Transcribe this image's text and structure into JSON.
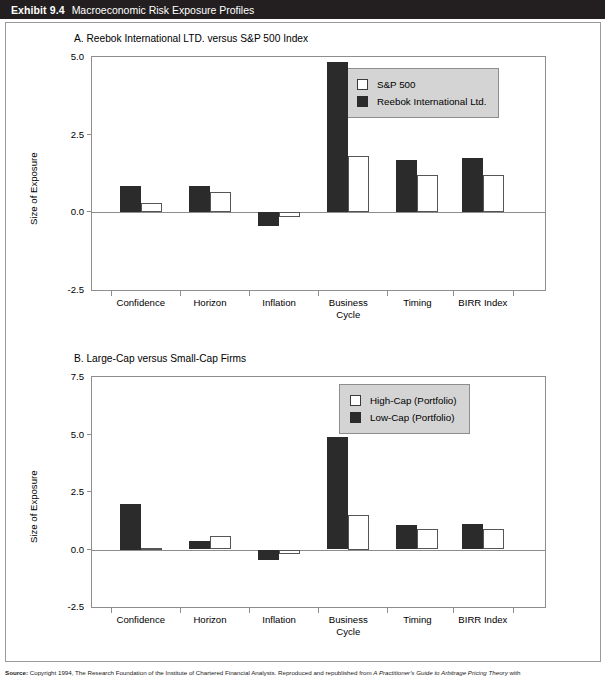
{
  "exhibit": {
    "number": "Exhibit 9.4",
    "title": "Macroeconomic Risk Exposure Profiles"
  },
  "source": {
    "label": "Source:",
    "text_before_italic": " Copyright 1994, The Research Foundation of the Institute of Chartered Financial Analysts. Reproduced and republished from ",
    "italic_title": "A Practitioner's Guide to Arbitrage Pricing Theory",
    "text_after_italic": " with"
  },
  "colors": {
    "header_bar": "#231f20",
    "dark_series": "#2b2b2b",
    "light_series": "#ffffff",
    "axis": "#8d8d8d",
    "legend_background": "#d4d4d4"
  },
  "chart_data": [
    {
      "id": "panel-a",
      "type": "bar",
      "title": "A. Reebok International LTD. versus S&P 500 Index",
      "xlabel": "",
      "ylabel": "Size of Exposure",
      "ylim": [
        -2.5,
        5.0
      ],
      "yticks": [
        5.0,
        2.5,
        0.0,
        -2.5
      ],
      "ytick_labels": [
        "5.0",
        "2.5",
        "0.0",
        "-2.5"
      ],
      "grid": false,
      "legend_position": "upper right",
      "categories": [
        "Confidence",
        "Horizon",
        "Inflation",
        "Business\nCycle",
        "Timing",
        "BIRR Index"
      ],
      "series": [
        {
          "name": "S&P 500",
          "style": "light",
          "values": [
            0.3,
            0.65,
            -0.15,
            1.8,
            1.2,
            1.2
          ]
        },
        {
          "name": "Reebok International Ltd.",
          "style": "dark",
          "values": [
            0.85,
            0.85,
            -0.45,
            4.85,
            1.7,
            1.75
          ]
        }
      ]
    },
    {
      "id": "panel-b",
      "type": "bar",
      "title": "B. Large-Cap versus Small-Cap Firms",
      "xlabel": "",
      "ylabel": "Size of Exposure",
      "ylim": [
        -2.5,
        7.5
      ],
      "yticks": [
        7.5,
        5.0,
        2.5,
        0.0,
        -2.5
      ],
      "ytick_labels": [
        "7.5",
        "5.0",
        "2.5",
        "0.0",
        "-2.5"
      ],
      "grid": false,
      "legend_position": "upper right",
      "categories": [
        "Confidence",
        "Horizon",
        "Inflation",
        "Business\nCycle",
        "Timing",
        "BIRR Index"
      ],
      "series": [
        {
          "name": "High-Cap (Portfolio)",
          "style": "light",
          "values": [
            0.08,
            0.6,
            -0.18,
            1.5,
            0.9,
            0.9
          ]
        },
        {
          "name": "Low-Cap (Portfolio)",
          "style": "dark",
          "values": [
            2.0,
            0.35,
            -0.45,
            4.9,
            1.05,
            1.1
          ]
        }
      ]
    }
  ]
}
